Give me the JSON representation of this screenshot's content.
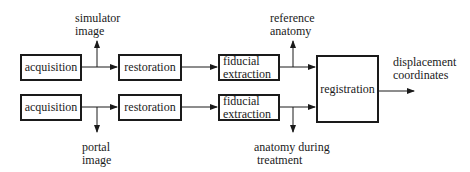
{
  "diagram": {
    "type": "flowchart",
    "colors": {
      "stroke": "#1a1a1a",
      "background": "#ffffff"
    },
    "boxes": {
      "acquisition_top": "acquisition",
      "restoration_top": "restoration",
      "fiducial_top": [
        "fiducial",
        "extraction"
      ],
      "acquisition_bottom": "acquisition",
      "restoration_bottom": "restoration",
      "fiducial_bottom": [
        "fiducial",
        "extraction"
      ],
      "registration": "registration"
    },
    "labels": {
      "simulator_image": [
        "simulator",
        "image"
      ],
      "reference_anatomy": [
        "reference",
        "anatomy"
      ],
      "portal_image": [
        "portal",
        "image"
      ],
      "anatomy_during_treatment": [
        "anatomy during",
        "treatment"
      ],
      "displacement_coordinates": [
        "displacement",
        "coordinates"
      ]
    },
    "edges": [
      {
        "from": "acquisition_top",
        "to": "restoration_top"
      },
      {
        "from": "acquisition_top",
        "to": "simulator_image"
      },
      {
        "from": "restoration_top",
        "to": "fiducial_top"
      },
      {
        "from": "fiducial_top",
        "to": "registration"
      },
      {
        "from": "fiducial_top",
        "to": "reference_anatomy"
      },
      {
        "from": "acquisition_bottom",
        "to": "restoration_bottom"
      },
      {
        "from": "acquisition_bottom",
        "to": "portal_image"
      },
      {
        "from": "restoration_bottom",
        "to": "fiducial_bottom"
      },
      {
        "from": "fiducial_bottom",
        "to": "registration"
      },
      {
        "from": "fiducial_bottom",
        "to": "anatomy_during_treatment"
      },
      {
        "from": "registration",
        "to": "displacement_coordinates"
      }
    ]
  }
}
